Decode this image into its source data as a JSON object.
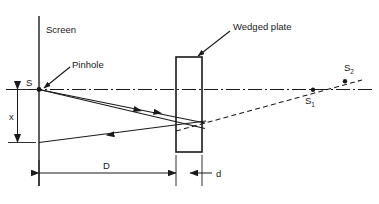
{
  "figure": {
    "type": "optics-ray-diagram",
    "background": "#ffffff",
    "ink": "#1a1a1a",
    "width": 379,
    "height": 204
  },
  "labels": {
    "screen": "Screen",
    "pinhole": "Pinhole",
    "wedged_plate": "Wedged plate",
    "source": "S",
    "image_1": "S",
    "image_1_sub": "1",
    "image_2": "S",
    "image_2_sub": "2",
    "dim_x": "x",
    "dim_D": "D",
    "dim_d": "d"
  },
  "elements": {
    "screen_line": {
      "x": 39,
      "y_top": 16,
      "y_bottom": 186
    },
    "optical_axis": {
      "y": 89,
      "x_start": 6,
      "x_end": 372,
      "style": "dash-dot"
    },
    "pinhole_point": {
      "x": 39,
      "y": 89
    },
    "plate": {
      "x": 176,
      "y": 57,
      "width": 26,
      "height": 95
    },
    "s1_point": {
      "x": 313,
      "y": 90
    },
    "s2_point": {
      "x": 345,
      "y": 84
    },
    "dim_x_line": {
      "x": 17,
      "y_top": 91,
      "y_bottom": 142
    },
    "dim_D_line": {
      "y": 173,
      "x_left": 39,
      "x_right": 176
    },
    "dim_d_line": {
      "y": 173,
      "x_left": 190,
      "x_right": 202
    }
  },
  "rays": {
    "upper_incident": {
      "from_x": 39,
      "from_y": 89,
      "to_x": 204,
      "to_y": 124
    },
    "lower_incident": {
      "from_x": 39,
      "from_y": 89,
      "to_x": 204,
      "to_y": 128
    },
    "return_ray": {
      "from_x": 204,
      "from_y": 122,
      "to_x": 39,
      "to_y": 142
    },
    "virtual_extension": {
      "from_x": 176,
      "from_y": 130,
      "to_x": 362,
      "to_y": 81,
      "style": "dashed"
    }
  },
  "leaders": {
    "pinhole_leader": {
      "from_x": 68,
      "from_y": 68,
      "to_x": 42,
      "to_y": 90
    },
    "plate_leader": {
      "from_x": 229,
      "from_y": 32,
      "to_x": 197,
      "to_y": 57
    }
  }
}
